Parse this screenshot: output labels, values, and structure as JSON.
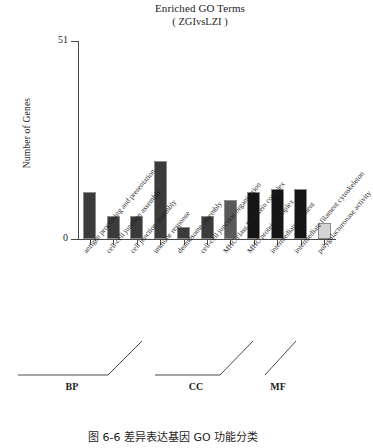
{
  "chart_data": {
    "type": "bar",
    "title": "Enriched GO Terms",
    "subtitle": "( ZGIvsLZI )",
    "xlabel": "",
    "ylabel": "Number of Genes",
    "ylim": [
      0,
      51
    ],
    "ytick_labels": [
      "51",
      "0"
    ],
    "grid": false,
    "legend": "none",
    "categories": [
      "antigen processing and presentation",
      "cell-cell junction assembly",
      "cell junction assembly",
      "immune response",
      "desmosome assembly",
      "cell-cell junction organization",
      "MHC class II protein complex",
      "MHC protein complex",
      "intermediate filament",
      "intermediate filament cytoskeleton",
      "polygalacturonase activity"
    ],
    "values": [
      12,
      6,
      6,
      20,
      3,
      6,
      10,
      12,
      13,
      13,
      4
    ],
    "bar_colors": [
      "#3b3b3b",
      "#3b3b3b",
      "#3b3b3b",
      "#3b3b3b",
      "#3b3b3b",
      "#3b3b3b",
      "#5a5a5a",
      "#151515",
      "#151515",
      "#151515",
      "#d4d4d4"
    ],
    "groups": [
      {
        "label": "BP",
        "start": 0,
        "end": 5
      },
      {
        "label": "CC",
        "start": 6,
        "end": 9
      },
      {
        "label": "MF",
        "start": 10,
        "end": 10
      }
    ]
  },
  "caption": "图 6-6   差异表达基因 GO 功能分类"
}
